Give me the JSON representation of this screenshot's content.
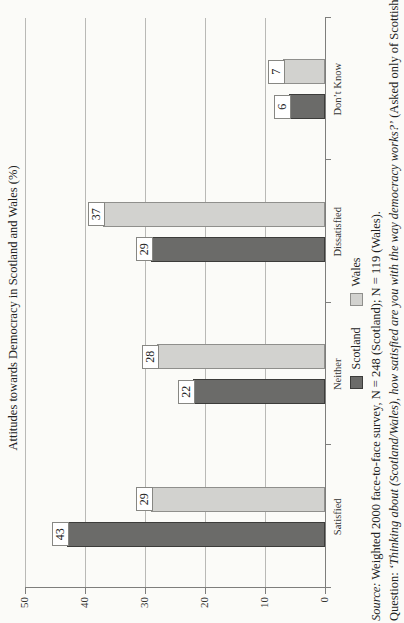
{
  "chart_data": {
    "type": "bar",
    "rotated_90_ccw_on_page": true,
    "title": "Attitudes towards Democracy in Scotland and Wales (%)",
    "categories": [
      "Satisfied",
      "Neither",
      "Dissatisfied",
      "Don’t Know"
    ],
    "series": [
      {
        "name": "Scotland",
        "color": "#6b6b69",
        "border_color": "#3c3c3a",
        "values": [
          43,
          22,
          29,
          6
        ]
      },
      {
        "name": "Wales",
        "color": "#d2d2cf",
        "border_color": "#8f8f8c",
        "values": [
          29,
          28,
          37,
          7
        ]
      }
    ],
    "ylim": [
      0,
      50
    ],
    "yticks": [
      0,
      10,
      20,
      30,
      40,
      50
    ],
    "grid": true,
    "data_labels_boxed": true,
    "legend_position": "bottom-center"
  },
  "footer": {
    "source_label": "Source:",
    "source_rest": " Weighted 2000 face-to-face survey, N = 248 (Scotland); N = 119 (Wales).",
    "question_label": "Question: ",
    "question_quote": "‘Thinking about (Scotland/Wales), how satisfied are you with the way democracy works?’",
    "question_rest": " (Asked only of Scottish"
  }
}
